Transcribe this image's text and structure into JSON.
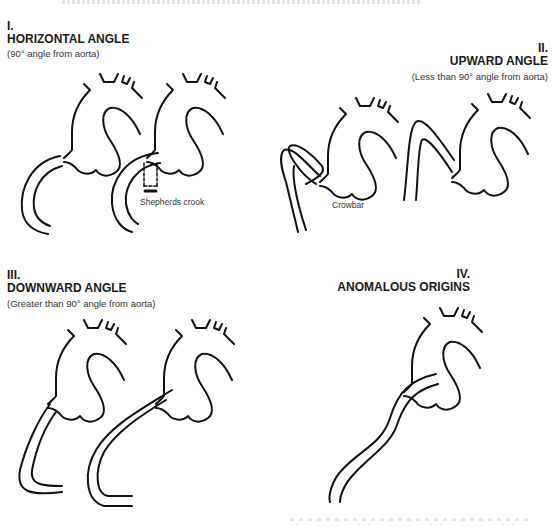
{
  "header": {
    "text": ""
  },
  "panels": [
    {
      "numeral": "I.",
      "title": "HORIZONTAL ANGLE",
      "subtitle": "(90° angle from aorta)",
      "annotation": "Shepherds crook"
    },
    {
      "numeral": "II.",
      "title": "UPWARD ANGLE",
      "subtitle": "(Less than 90° angle from aorta)",
      "annotation": "Crowbar"
    },
    {
      "numeral": "III.",
      "title": "DOWNWARD ANGLE",
      "subtitle": "(Greater than 90° angle from aorta)"
    },
    {
      "numeral": "IV.",
      "title": "ANOMALOUS ORIGINS"
    }
  ],
  "colors": {
    "line": "#111111",
    "text": "#1a1a1a",
    "background": "#ffffff"
  }
}
